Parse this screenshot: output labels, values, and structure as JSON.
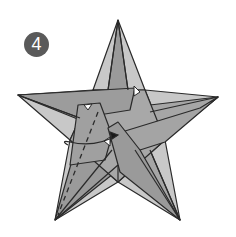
{
  "diagram": {
    "step_number": "4",
    "colors": {
      "background": "#ffffff",
      "paper_dark": "#9a9a9a",
      "paper_light": "#c8c8c8",
      "paper_mid": "#b0b0b0",
      "line": "#2a2a2a",
      "badge": "#5a5a5a",
      "badge_text": "#ffffff"
    },
    "elements": [
      {
        "type": "step-badge",
        "label": "4"
      },
      {
        "type": "star",
        "points": 5
      },
      {
        "type": "dashed-fold-line",
        "description": "valley fold on lower-left flap"
      },
      {
        "type": "arrow",
        "description": "curved arrow tucking flap toward center"
      }
    ]
  }
}
